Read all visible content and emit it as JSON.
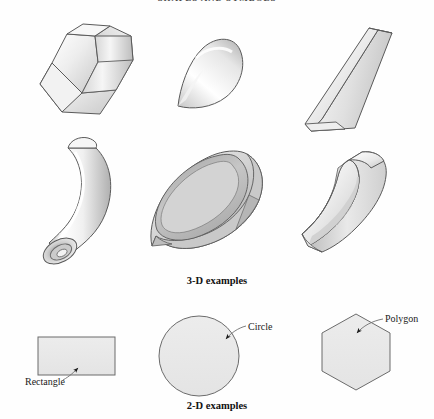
{
  "page": {
    "width": 434,
    "height": 419,
    "background": "#ffffff",
    "running_head": "SHAPES AND SYMBOLS"
  },
  "captions": {
    "three_d": "3-D examples",
    "two_d": "2-D examples"
  },
  "callouts": [
    {
      "id": "rectangle",
      "label": "Rectangle"
    },
    {
      "id": "circle",
      "label": "Circle"
    },
    {
      "id": "polygon",
      "label": "Polygon"
    }
  ],
  "colors": {
    "outline": "#555555",
    "fill_light": "#fbfbfb",
    "fill_mid": "#e3e3e3",
    "fill_dark": "#b9b9b9",
    "fill_shadow": "#9a9a9a",
    "text": "#111111",
    "leader": "#777777"
  },
  "figures": {
    "three_d": [
      {
        "id": "hexagonal-prism",
        "name": "hexagonal prism",
        "row": 1,
        "col": 1
      },
      {
        "id": "cone",
        "name": "cone",
        "row": 1,
        "col": 2
      },
      {
        "id": "triangular-prism",
        "name": "triangular prism",
        "row": 1,
        "col": 3
      },
      {
        "id": "bent-tube",
        "name": "bent tube",
        "row": 2,
        "col": 1
      },
      {
        "id": "teardrop-shell",
        "name": "teardrop shell",
        "row": 2,
        "col": 2
      },
      {
        "id": "curved-block",
        "name": "curved block",
        "row": 2,
        "col": 3
      }
    ],
    "two_d": [
      {
        "id": "rectangle",
        "name": "rectangle",
        "label": "Rectangle"
      },
      {
        "id": "circle",
        "name": "circle",
        "label": "Circle"
      },
      {
        "id": "hexagon",
        "name": "polygon",
        "label": "Polygon"
      }
    ]
  }
}
